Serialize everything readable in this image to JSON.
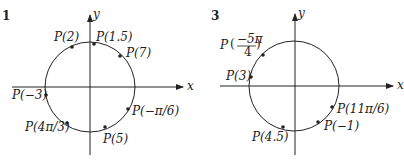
{
  "figures": [
    {
      "number": "1",
      "x_axis_label": "x",
      "y_axis_label": "y",
      "points": [
        {
          "label": "P(2)",
          "t": "2"
        },
        {
          "label": "P(1.5)",
          "t": "1.5"
        },
        {
          "label": "P(7)",
          "t": "7"
        },
        {
          "label": "P(−3)",
          "t": "-3"
        },
        {
          "label": "P(−π/6)",
          "t": "-pi/6"
        },
        {
          "label": "P(4π/3)",
          "t": "4pi/3"
        },
        {
          "label": "P(5)",
          "t": "5"
        }
      ]
    },
    {
      "number": "3",
      "x_axis_label": "x",
      "y_axis_label": "y",
      "points": [
        {
          "label": "P",
          "frac_num": "−5π",
          "frac_den": "4",
          "t": "-5pi/4"
        },
        {
          "label": "P(3)",
          "t": "3"
        },
        {
          "label": "P(11π/6)",
          "t": "11pi/6"
        },
        {
          "label": "P(−1)",
          "t": "-1"
        },
        {
          "label": "P(4.5)",
          "t": "4.5"
        }
      ]
    }
  ],
  "colors": {
    "ink": "#222222",
    "background": "#ffffff"
  }
}
